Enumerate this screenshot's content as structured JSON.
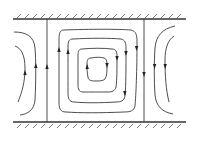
{
  "diagram": {
    "title": "",
    "colors": {
      "background": "#ffffff",
      "lines": "#3a3a3a",
      "walls": "#333333"
    },
    "walls": [
      {
        "name": "top-wall",
        "y": 19,
        "x1": 13,
        "x2": 186,
        "hatch_side": "above"
      },
      {
        "name": "bottom-wall",
        "y": 122,
        "x1": 13,
        "x2": 186,
        "hatch_side": "below"
      }
    ],
    "dividers": [
      {
        "name": "left-divider",
        "x": 47,
        "arrow": "up"
      },
      {
        "name": "right-divider",
        "x": 144,
        "arrow": "down"
      }
    ],
    "central_cell": {
      "rotation": "clockwise",
      "loop_count": 4
    },
    "left_partial_cell": {
      "curve_count": 2,
      "arrow": "up"
    },
    "right_partial_cell": {
      "curve_count": 2,
      "arrow": "down"
    }
  }
}
